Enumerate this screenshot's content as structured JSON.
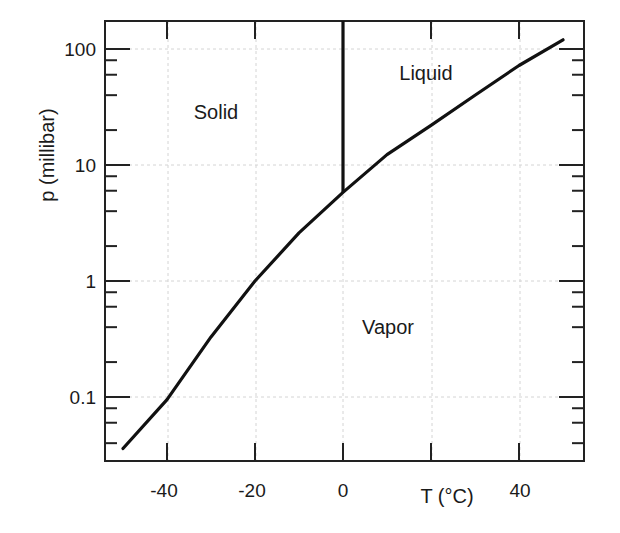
{
  "chart_data": {
    "type": "line",
    "title": "",
    "xlabel": "T (°C)",
    "ylabel": "p (millibar)",
    "xscale": "linear",
    "yscale": "log",
    "xlim": [
      -54,
      55
    ],
    "ylim": [
      0.025,
      160
    ],
    "grid": true,
    "x_ticks": [
      -40,
      -20,
      0,
      20,
      40
    ],
    "x_tick_labels": [
      "-40",
      "-20",
      "0",
      "",
      "40"
    ],
    "y_ticks": [
      0.1,
      1,
      10,
      100
    ],
    "y_tick_labels": [
      "0.1",
      "1",
      "10",
      "100"
    ],
    "series": [
      {
        "name": "sublimation/vaporization curve",
        "x": [
          -50,
          -40,
          -30,
          -20,
          -10,
          0,
          10,
          20,
          30,
          40,
          50
        ],
        "y": [
          0.036,
          0.095,
          0.33,
          1.0,
          2.6,
          5.8,
          12.3,
          22,
          40,
          72,
          120
        ]
      },
      {
        "name": "melting curve",
        "x": [
          0,
          0
        ],
        "y": [
          5.8,
          160
        ]
      }
    ],
    "annotations": [
      {
        "text": "Solid",
        "x": -28,
        "y": 28
      },
      {
        "text": "Liquid",
        "x": 18,
        "y": 100
      },
      {
        "text": "Vapor",
        "x": 15,
        "y": 0.35
      }
    ]
  },
  "labels": {
    "x_axis": "T (°C)",
    "y_axis": "p (millibar)",
    "solid": "Solid",
    "liquid": "Liquid",
    "vapor": "Vapor",
    "x_ticks": [
      "-40",
      "-20",
      "0",
      "40"
    ],
    "y_ticks": [
      "100",
      "10",
      "1",
      "0.1"
    ]
  }
}
